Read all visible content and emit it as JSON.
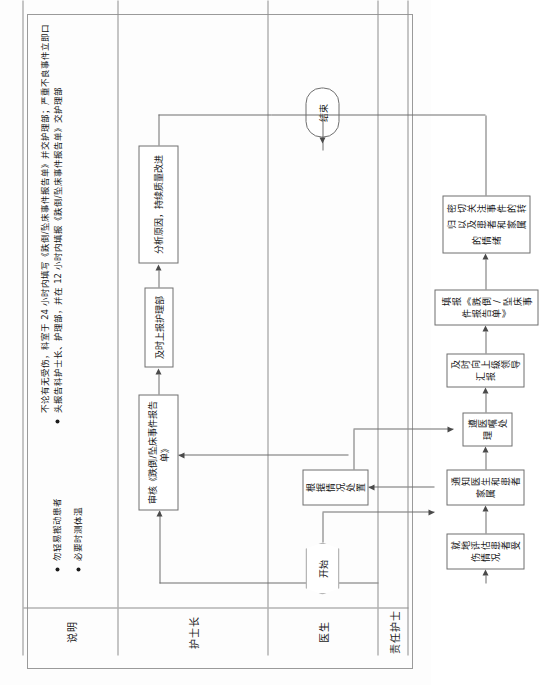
{
  "document": {
    "title": "跌倒/坠床事件处理流程",
    "orientation": "rotated-90"
  },
  "lanes": [
    {
      "id": "notes",
      "label": "说明"
    },
    {
      "id": "head-nurse",
      "label": "护士长"
    },
    {
      "id": "doctor",
      "label": "医生"
    },
    {
      "id": "responsible-nurse",
      "label": "责任护士"
    }
  ],
  "notes": {
    "group1": [
      "勿轻易搬动患者",
      "必要时测体温"
    ],
    "group2": [
      "不论有无受伤，科室于 24 小时内填写《跌倒/坠床事件报告单》并交护理部；严重不良事件立即口头报告科护士长、护理部，并在 12 小时内填报《跌倒/坠床事件报告单》交护理部"
    ],
    "group2_lines": [
      "不论有无受伤，科",
      "室于 24 小时内填写",
      "《跌倒/坠床事件",
      "报告单》并交护",
      "理部；严重不良事",
      "件立即口头报告科",
      "护士长、护理部，",
      "并在 12 小时内填报",
      "《跌倒/坠床事件",
      "报告单》交护理部"
    ]
  },
  "nodes": {
    "start": {
      "label": "开始",
      "shape": "hexagon",
      "lane": "doctor"
    },
    "end": {
      "label": "结束",
      "shape": "terminator",
      "lane": "doctor"
    },
    "doctor1": {
      "label": "根据情况处置",
      "shape": "process",
      "lane": "doctor"
    },
    "rn1": {
      "label": "就地评估患者受伤情况",
      "shape": "process",
      "lane": "responsible-nurse"
    },
    "rn2": {
      "label": "通知医生和患者家属",
      "shape": "process",
      "lane": "responsible-nurse"
    },
    "rn3": {
      "label": "遵医嘱处理",
      "shape": "process",
      "lane": "responsible-nurse"
    },
    "rn4": {
      "label": "及时向上级领导汇报",
      "shape": "process",
      "lane": "responsible-nurse"
    },
    "rn5": {
      "label": "填报《跌倒/坠床事件报告单》",
      "shape": "process",
      "lane": "responsible-nurse"
    },
    "rn6_line1": "密切关注事件的转归以及患",
    "rn6_line2": "者和家属的情绪",
    "rn6": {
      "label": "密切关注事件的转归以及患者和家属的情绪",
      "shape": "process",
      "lane": "responsible-nurse"
    },
    "hn1": {
      "label": "审核《跌倒/坠床事件报告单》",
      "shape": "process",
      "lane": "head-nurse"
    },
    "hn2": {
      "label": "及时上报护理部",
      "shape": "process",
      "lane": "head-nurse"
    },
    "hn3_line1": "分析原因，持续质量改进",
    "hn3": {
      "label": "分析原因，持续质量改进",
      "shape": "process",
      "lane": "head-nurse"
    }
  },
  "colors": {
    "line": "#6f6f6f",
    "frame": "#9a9a9a",
    "text": "#141414",
    "paper": "#fdfdfd"
  }
}
